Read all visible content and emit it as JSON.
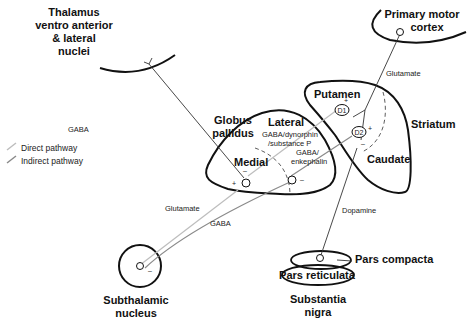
{
  "colors": {
    "structure": "#111111",
    "direct_pathway": "#bdbdbd",
    "indirect_pathway": "#8a8a8a",
    "projection": "#333333"
  },
  "legend": {
    "direct": "Direct pathway",
    "indirect": "Indirect pathway"
  },
  "structures": {
    "thalamus": [
      "Thalamus",
      "ventro anterior",
      "& lateral",
      "nuclei"
    ],
    "motor_cortex": [
      "Primary motor",
      "cortex"
    ],
    "globus_pallidus": [
      "Globus",
      "pallidus"
    ],
    "gp_lateral": "Lateral",
    "gp_medial": "Medial",
    "putamen": "Putamen",
    "caudate": "Caudate",
    "striatum": "Striatum",
    "subthalamic": [
      "Subthalamic",
      "nucleus"
    ],
    "pars_compacta": "Pars compacta",
    "pars_reticulata": "Pars reticulata",
    "substantia_nigra": [
      "Substantia",
      "nigra"
    ]
  },
  "neurotransmitters": {
    "gaba_thalamus": "GABA",
    "glutamate_cortex": "Glutamate",
    "gaba_dynorphin": [
      "GABA/dynorphin",
      "/substance P"
    ],
    "gaba_enkephalin": [
      "GABA/",
      "enkephalin"
    ],
    "glutamate_stn": "Glutamate",
    "gaba_stn": "GABA",
    "dopamine": "Dopamine"
  },
  "receptors": {
    "d1": "D1",
    "d2": "D2"
  },
  "signs": {
    "plus": "+",
    "minus": "–"
  }
}
